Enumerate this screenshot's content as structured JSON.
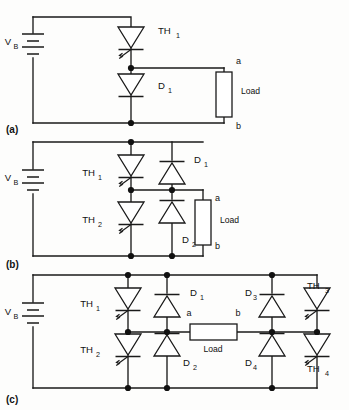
{
  "figure": {
    "background_color": "#fdfdfc",
    "ink_color": "#1a1a1a",
    "panels": [
      {
        "id": "a",
        "label": "(a)",
        "source_label": "V",
        "source_sub": "B",
        "load_label": "Load",
        "node_top_label": "a",
        "node_bottom_label": "b",
        "devices": [
          {
            "name": "TH",
            "sub": "1",
            "type": "thyristor"
          },
          {
            "name": "D",
            "sub": "1",
            "type": "diode"
          }
        ]
      },
      {
        "id": "b",
        "label": "(b)",
        "source_label": "V",
        "source_sub": "B",
        "load_label": "Load",
        "node_top_label": "a",
        "node_bottom_label": "b",
        "devices": [
          {
            "name": "TH",
            "sub": "1",
            "type": "thyristor"
          },
          {
            "name": "TH",
            "sub": "2",
            "type": "thyristor"
          },
          {
            "name": "D",
            "sub": "1",
            "type": "diode"
          },
          {
            "name": "D",
            "sub": "2",
            "type": "diode"
          }
        ]
      },
      {
        "id": "c",
        "label": "(c)",
        "source_label": "V",
        "source_sub": "B",
        "load_label": "Load",
        "node_left_label": "a",
        "node_right_label": "b",
        "devices": [
          {
            "name": "TH",
            "sub": "1",
            "type": "thyristor"
          },
          {
            "name": "TH",
            "sub": "2",
            "type": "thyristor"
          },
          {
            "name": "TH",
            "sub": "3",
            "type": "thyristor"
          },
          {
            "name": "TH",
            "sub": "4",
            "type": "thyristor"
          },
          {
            "name": "D",
            "sub": "1",
            "type": "diode"
          },
          {
            "name": "D",
            "sub": "2",
            "type": "diode"
          },
          {
            "name": "D",
            "sub": "3",
            "type": "diode"
          },
          {
            "name": "D",
            "sub": "4",
            "type": "diode"
          }
        ]
      }
    ],
    "labels": {
      "panel_a": "(a)",
      "panel_b": "(b)",
      "panel_c": "(c)",
      "vb_main": "V",
      "vb_sub": "B",
      "load": "Load",
      "node_a": "a",
      "node_b": "b",
      "th": "TH",
      "d": "D",
      "one": "1",
      "two": "2",
      "three": "3",
      "four": "4"
    }
  }
}
